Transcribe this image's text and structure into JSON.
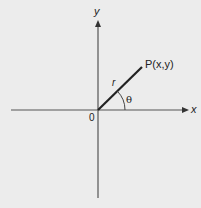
{
  "diagram": {
    "type": "polar-coordinate-diagram",
    "labels": {
      "y_axis": "y",
      "x_axis": "x",
      "origin": "0",
      "point": "P(x,y)",
      "radius": "r",
      "angle": "θ"
    },
    "colors": {
      "background": "#ececec",
      "axis": "#555555",
      "radius_line": "#222222",
      "text": "#222222"
    },
    "geometry": {
      "origin": [
        98,
        110
      ],
      "x_axis": [
        [
          11,
          110
        ],
        [
          188,
          110
        ]
      ],
      "y_axis": [
        [
          98,
          198
        ],
        [
          98,
          20
        ]
      ],
      "radius_line": [
        [
          98,
          110
        ],
        [
          142,
          67
        ]
      ],
      "angle_arc_radius": 27
    }
  }
}
